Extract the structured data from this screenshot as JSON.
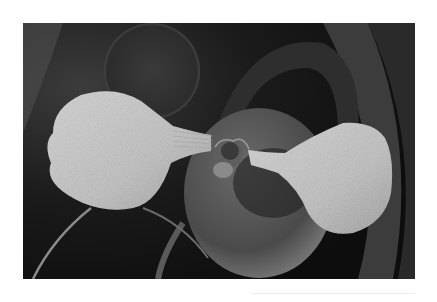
{
  "image": {
    "description": "Grayscale scanning electron micrograph of a seedling with two spoon-shaped cotyledons on stalks joined at a central shoot, over darker background spheres and curved leaf structures",
    "alt": "Seedling micrograph",
    "palette": {
      "page_background": "#ffffff",
      "photo_background": "#111111",
      "cotyledon": "#c9c9c9",
      "cotyledon_shadow": "#9a9a9a",
      "background_sphere": "#3a3a3a",
      "central_disc": "#555555",
      "leaf_curve": "#4a4a4a",
      "rule_line": "#ececec"
    }
  }
}
